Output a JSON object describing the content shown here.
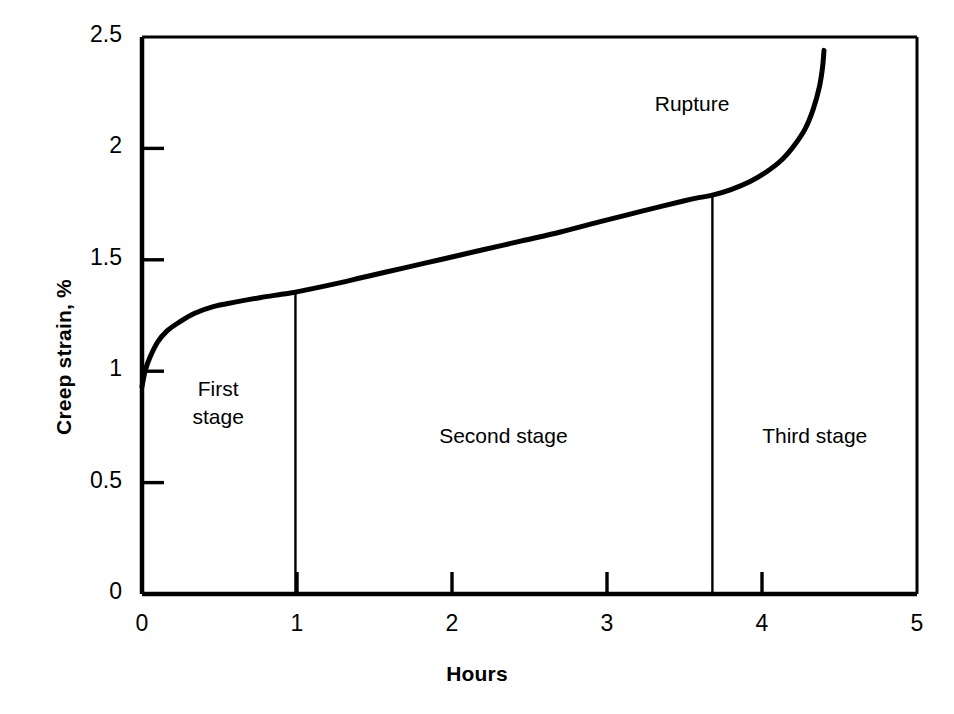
{
  "chart_data": {
    "type": "line",
    "title": "",
    "xlabel": "Hours",
    "ylabel": "Creep strain, %",
    "xlim": [
      0,
      5
    ],
    "ylim": [
      0,
      2.5
    ],
    "grid": false,
    "legend": "none",
    "xticks": [
      {
        "value": 0,
        "label": "0"
      },
      {
        "value": 1,
        "label": "1"
      },
      {
        "value": 2,
        "label": "2"
      },
      {
        "value": 3,
        "label": "3"
      },
      {
        "value": 4,
        "label": "4"
      },
      {
        "value": 5,
        "label": "5"
      }
    ],
    "yticks": [
      {
        "value": 0,
        "label": "0"
      },
      {
        "value": 0.5,
        "label": "0.5"
      },
      {
        "value": 1,
        "label": "1"
      },
      {
        "value": 1.5,
        "label": "1.5"
      },
      {
        "value": 2,
        "label": "2"
      },
      {
        "value": 2.5,
        "label": "2.5"
      }
    ],
    "series": [
      {
        "name": "creep curve",
        "color": "#000000",
        "points": [
          [
            0.0,
            0.93
          ],
          [
            0.02,
            1.0
          ],
          [
            0.05,
            1.06
          ],
          [
            0.1,
            1.13
          ],
          [
            0.16,
            1.18
          ],
          [
            0.24,
            1.22
          ],
          [
            0.34,
            1.26
          ],
          [
            0.46,
            1.29
          ],
          [
            0.6,
            1.31
          ],
          [
            0.76,
            1.33
          ],
          [
            0.9,
            1.345
          ],
          [
            0.99,
            1.355
          ],
          [
            1.2,
            1.385
          ],
          [
            1.45,
            1.425
          ],
          [
            1.7,
            1.465
          ],
          [
            1.95,
            1.505
          ],
          [
            2.2,
            1.545
          ],
          [
            2.45,
            1.585
          ],
          [
            2.7,
            1.625
          ],
          [
            2.95,
            1.67
          ],
          [
            3.15,
            1.705
          ],
          [
            3.35,
            1.74
          ],
          [
            3.5,
            1.765
          ],
          [
            3.6,
            1.78
          ],
          [
            3.68,
            1.79
          ],
          [
            3.8,
            1.815
          ],
          [
            3.92,
            1.85
          ],
          [
            4.03,
            1.895
          ],
          [
            4.13,
            1.95
          ],
          [
            4.21,
            2.015
          ],
          [
            4.28,
            2.09
          ],
          [
            4.33,
            2.175
          ],
          [
            4.37,
            2.275
          ],
          [
            4.39,
            2.36
          ],
          [
            4.4,
            2.44
          ]
        ]
      }
    ],
    "dividers": [
      {
        "x": 0.99,
        "y_top": 1.355,
        "label": "first-second-stage-divider"
      },
      {
        "x": 3.68,
        "y_top": 1.79,
        "label": "second-third-stage-divider"
      }
    ],
    "annotations": [
      {
        "name": "rupture",
        "text": "Rupture",
        "x": 3.55,
        "y": 2.2
      },
      {
        "name": "first-stage",
        "text": "First\nstage",
        "x": 0.49,
        "y": 0.86
      },
      {
        "name": "second-stage",
        "text": "Second stage",
        "x": 2.33,
        "y": 0.71
      },
      {
        "name": "third-stage",
        "text": "Third stage",
        "x": 4.34,
        "y": 0.71
      }
    ],
    "colors": {
      "axis": "#000000",
      "curve": "#000000",
      "divider": "#000000",
      "background": "#ffffff"
    }
  }
}
